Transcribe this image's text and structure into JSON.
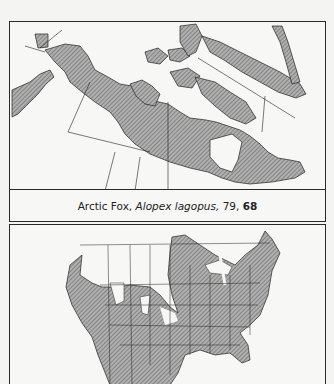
{
  "maps": [
    {
      "id": "top",
      "region": "Northern North America and Greenland",
      "shading": "hatched range",
      "caption": {
        "common_name": "Arctic Fox,",
        "scientific_name": "Alopex lagopus,",
        "page_ref": "79,",
        "plate_ref": "68"
      }
    },
    {
      "id": "bottom",
      "region": "United States and Mexico",
      "shading": "hatched range"
    }
  ],
  "colors": {
    "hatch": "#8a8a8a",
    "border": "#2a2a2a",
    "paper": "#f7f7f5"
  }
}
